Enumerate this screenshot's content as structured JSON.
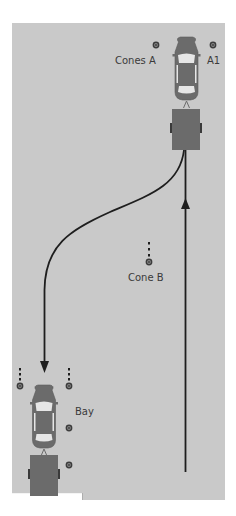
{
  "diagram": {
    "colors": {
      "ground": "#c9c9c9",
      "background": "#ffffff",
      "vehicle": "#6b6b6b",
      "vehicle_outline": "#5a5a5a",
      "window": "#e6e6e6",
      "path": "#1e1e1e",
      "cone": "#3c3c3c",
      "label": "#3a3a3a"
    },
    "labels": {
      "cones_a": "Cones A",
      "a1": "A1",
      "cone_b": "Cone B",
      "bay": "Bay"
    },
    "vehicles": [
      {
        "name": "start-car-trailer",
        "position": "top-right",
        "orientation": "facing up"
      },
      {
        "name": "end-car-trailer",
        "position": "bottom-left",
        "orientation": "facing up, parked in bay"
      }
    ],
    "paths": [
      {
        "name": "forward-path",
        "direction": "up",
        "description": "straight line from bottom right up to trailer"
      },
      {
        "name": "reverse-path",
        "direction": "down",
        "description": "S-curve from trailer at top right down to bay at bottom left"
      }
    ],
    "cones": [
      {
        "name": "cones-a-left"
      },
      {
        "name": "cone-a1"
      },
      {
        "name": "cone-b"
      },
      {
        "name": "bay-cone-left"
      },
      {
        "name": "bay-cone-right"
      },
      {
        "name": "bay-cone-side-1"
      },
      {
        "name": "bay-cone-side-2"
      }
    ]
  }
}
